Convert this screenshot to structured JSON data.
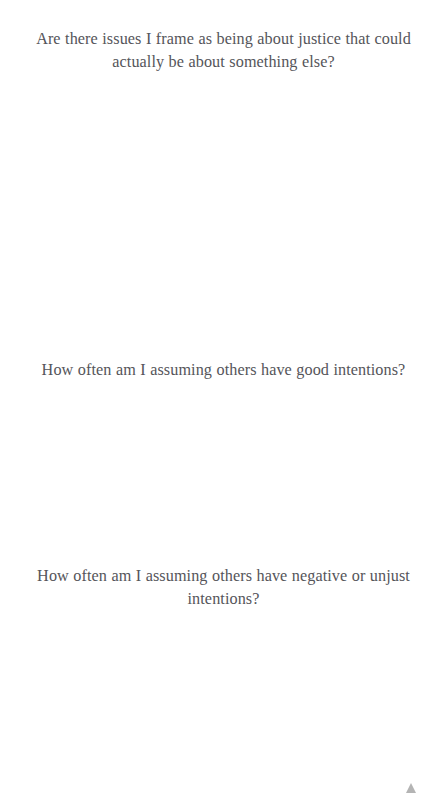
{
  "page": {
    "background_color": "#ffffff",
    "text_color": "#55555a",
    "width": 447,
    "height": 793
  },
  "prompts": [
    {
      "id": "justice-framing",
      "text": "Are there issues I frame as being about justice that could actually be about something else?"
    },
    {
      "id": "good-intentions",
      "text": "How often am I assuming others have good intentions?"
    },
    {
      "id": "negative-intentions",
      "text": "How often am I assuming others have negative or unjust intentions?"
    }
  ],
  "controls": {
    "scroll_to_top": {
      "label": "Scroll to top",
      "icon": "triangle-up-icon",
      "color": "#b4b4b4"
    }
  }
}
